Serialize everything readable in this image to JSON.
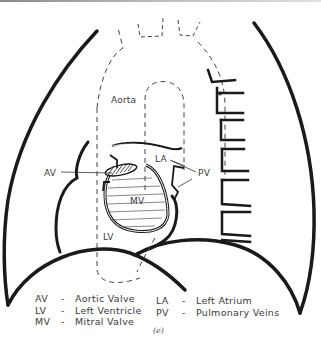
{
  "figure": {
    "caption": "(e)",
    "labels": {
      "aorta": "Aorta",
      "la": "LA",
      "av": "AV",
      "pv": "PV",
      "mv": "MV",
      "lv": "LV"
    },
    "legend": [
      {
        "abbr": "AV",
        "dash": "-",
        "meaning": "Aortic Valve"
      },
      {
        "abbr": "LV",
        "dash": "-",
        "meaning": "Left Ventricle"
      },
      {
        "abbr": "MV",
        "dash": "-",
        "meaning": "Mitral Valve"
      },
      {
        "abbr": "LA",
        "dash": "-",
        "meaning": "Left Atrium"
      },
      {
        "abbr": "PV",
        "dash": "-",
        "meaning": "Pulmonary Veins"
      }
    ],
    "colors": {
      "ink": "#1a1a1a",
      "text": "#3a3a3a",
      "background": "#ffffff"
    }
  }
}
